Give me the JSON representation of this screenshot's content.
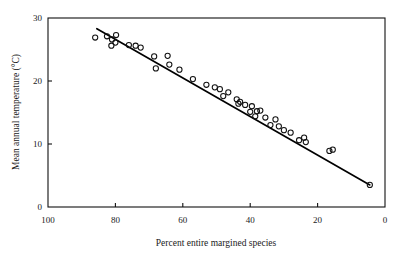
{
  "figure": {
    "background_color": "#ffffff",
    "ink_color": "#111111"
  },
  "chart_data": {
    "type": "scatter",
    "title": "",
    "subtitle": "",
    "xlabel": "Percent entire margined species",
    "ylabel": "Mean annual temperature (°C)",
    "xlim": [
      100,
      0
    ],
    "ylim": [
      0,
      30
    ],
    "x_axis_reversed": true,
    "grid": false,
    "legend": null,
    "legend_position": "none",
    "xticks": [
      100,
      80,
      60,
      40,
      20,
      0
    ],
    "xtick_labels": [
      "100",
      "80",
      "60",
      "40",
      "20",
      "0"
    ],
    "yticks": [
      0,
      10,
      20,
      30
    ],
    "ytick_labels": [
      "0",
      "10",
      "20",
      "30"
    ],
    "marker_style": "open-circle",
    "marker_radius_px": 2.6,
    "points": [
      {
        "x": 86.0,
        "y": 26.9
      },
      {
        "x": 82.5,
        "y": 27.1
      },
      {
        "x": 81.0,
        "y": 26.6
      },
      {
        "x": 81.2,
        "y": 25.6
      },
      {
        "x": 80.0,
        "y": 26.1
      },
      {
        "x": 79.8,
        "y": 27.3
      },
      {
        "x": 76.0,
        "y": 25.7
      },
      {
        "x": 74.0,
        "y": 25.6
      },
      {
        "x": 72.5,
        "y": 25.3
      },
      {
        "x": 68.5,
        "y": 23.9
      },
      {
        "x": 68.0,
        "y": 22.0
      },
      {
        "x": 64.5,
        "y": 24.0
      },
      {
        "x": 64.0,
        "y": 22.6
      },
      {
        "x": 61.0,
        "y": 21.8
      },
      {
        "x": 57.0,
        "y": 20.3
      },
      {
        "x": 53.0,
        "y": 19.4
      },
      {
        "x": 50.5,
        "y": 19.0
      },
      {
        "x": 49.0,
        "y": 18.7
      },
      {
        "x": 48.0,
        "y": 17.6
      },
      {
        "x": 46.5,
        "y": 18.2
      },
      {
        "x": 44.0,
        "y": 17.1
      },
      {
        "x": 43.5,
        "y": 16.4
      },
      {
        "x": 43.0,
        "y": 16.7
      },
      {
        "x": 41.5,
        "y": 16.2
      },
      {
        "x": 40.0,
        "y": 15.1
      },
      {
        "x": 39.5,
        "y": 16.0
      },
      {
        "x": 38.5,
        "y": 14.4
      },
      {
        "x": 38.0,
        "y": 15.2
      },
      {
        "x": 37.0,
        "y": 15.3
      },
      {
        "x": 35.5,
        "y": 14.2
      },
      {
        "x": 34.0,
        "y": 13.0
      },
      {
        "x": 32.5,
        "y": 13.9
      },
      {
        "x": 31.5,
        "y": 12.8
      },
      {
        "x": 30.0,
        "y": 12.2
      },
      {
        "x": 28.0,
        "y": 11.8
      },
      {
        "x": 25.5,
        "y": 10.6
      },
      {
        "x": 24.0,
        "y": 11.0
      },
      {
        "x": 23.5,
        "y": 10.3
      },
      {
        "x": 16.5,
        "y": 8.9
      },
      {
        "x": 15.5,
        "y": 9.1
      },
      {
        "x": 4.5,
        "y": 3.5
      }
    ],
    "fit_line": {
      "label": "",
      "x_start": 85.5,
      "y_start": 28.3,
      "x_end": 4.5,
      "y_end": 3.5
    }
  }
}
